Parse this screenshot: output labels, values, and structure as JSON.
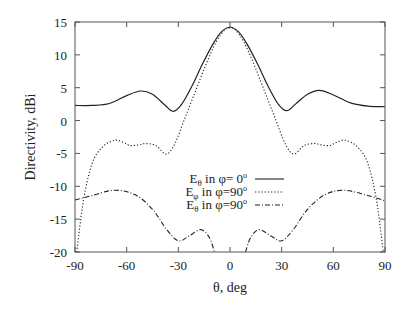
{
  "chart_data": {
    "type": "line",
    "title": "",
    "xlabel": "θ, deg",
    "ylabel": "Directivity, dBi",
    "xlim": [
      -90,
      90
    ],
    "ylim": [
      -20,
      15
    ],
    "xticks": [
      -90,
      -60,
      -30,
      0,
      30,
      60,
      90
    ],
    "yticks": [
      15,
      10,
      5,
      0,
      -5,
      -10,
      -15,
      -20
    ],
    "grid": false,
    "legend_position": "center-lower",
    "series": [
      {
        "name": "Eθ in φ= 0°",
        "style": "solid",
        "x": [
          -90,
          -80,
          -70,
          -60,
          -52,
          -45,
          -38,
          -33,
          -28,
          -22,
          -16,
          -10,
          -5,
          0,
          5,
          10,
          16,
          22,
          28,
          33,
          38,
          45,
          52,
          60,
          70,
          80,
          90
        ],
        "y": [
          2.3,
          2.3,
          2.6,
          3.8,
          4.5,
          4.0,
          2.4,
          1.4,
          2.5,
          5.3,
          8.6,
          11.6,
          13.5,
          14.2,
          13.5,
          11.6,
          8.6,
          5.3,
          2.5,
          1.5,
          2.5,
          4.0,
          4.6,
          3.9,
          2.7,
          2.2,
          2.1
        ]
      },
      {
        "name": "Eφ in φ=90°",
        "style": "dotted",
        "x": [
          -89,
          -85,
          -80,
          -74,
          -67,
          -62,
          -58,
          -53,
          -49,
          -43,
          -37,
          -32,
          -26,
          -20,
          -14,
          -8,
          -3,
          0,
          3,
          8,
          14,
          20,
          26,
          32,
          37,
          43,
          49,
          53,
          58,
          62,
          67,
          74,
          80,
          85,
          89
        ],
        "y": [
          -20,
          -12,
          -6.5,
          -4.0,
          -3.0,
          -3.3,
          -3.8,
          -3.7,
          -3.5,
          -3.8,
          -5.1,
          -3.5,
          0.5,
          4.5,
          8.5,
          12.0,
          13.8,
          14.1,
          13.8,
          12.0,
          8.5,
          4.5,
          0.5,
          -3.5,
          -5.1,
          -3.8,
          -3.5,
          -3.7,
          -3.8,
          -3.3,
          -3.0,
          -4.0,
          -6.5,
          -12,
          -20
        ]
      },
      {
        "name": "Eθ in φ=90°",
        "style": "dash-dot",
        "x": [
          -90,
          -80,
          -67,
          -55,
          -45,
          -37,
          -30,
          -24,
          -17,
          -12,
          -9,
          9,
          12,
          17,
          24,
          30,
          37,
          45,
          55,
          66,
          80,
          90
        ],
        "y": [
          -12.1,
          -11.4,
          -10.6,
          -11.3,
          -13.5,
          -16.5,
          -18.3,
          -17.6,
          -16.6,
          -17.8,
          -20,
          -20,
          -17.8,
          -16.6,
          -17.6,
          -18.3,
          -16.5,
          -13.5,
          -11.3,
          -10.6,
          -11.4,
          -12.2
        ]
      }
    ]
  },
  "legend": {
    "items": [
      {
        "base": "E",
        "sub": "θ",
        "text": " in φ= 0",
        "sup": "o",
        "style": "solid"
      },
      {
        "base": "E",
        "sub": "φ",
        "text": " in φ=90",
        "sup": "o",
        "style": "dotted"
      },
      {
        "base": "E",
        "sub": "θ",
        "text": " in φ=90",
        "sup": "o",
        "style": "dash-dot"
      }
    ]
  },
  "colors": {
    "line": "#222222",
    "axis": "#555555"
  }
}
